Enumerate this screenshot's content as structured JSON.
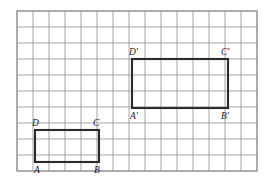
{
  "figure": {
    "background_color": "#ffffff",
    "grid": {
      "origin_x": 17,
      "origin_y": 11,
      "cell_size": 16,
      "columns": 15,
      "rows": 10,
      "line_color": "#9b9b9b",
      "faint_line_color": "#c9c9c9",
      "frame_color": "#8c8c8c",
      "show_grid": true
    },
    "shape_color": "#2b2b2b",
    "shapes": [
      {
        "name": "rectangle-abcd",
        "type": "rectangle",
        "grid_x": 1,
        "grid_y": 7.45,
        "grid_width": 4,
        "grid_height": 2,
        "px": {
          "x": 35,
          "y": 130,
          "width": 64,
          "height": 32
        },
        "vertices": [
          {
            "id": "A",
            "label": "A",
            "corner": "bottom-left",
            "label_x": 34,
            "label_y": 173
          },
          {
            "id": "B",
            "label": "B",
            "corner": "bottom-right",
            "label_x": 94,
            "label_y": 173
          },
          {
            "id": "C",
            "label": "C",
            "corner": "top-right",
            "label_x": 93,
            "label_y": 126
          },
          {
            "id": "D",
            "label": "D",
            "corner": "top-left",
            "label_x": 32,
            "label_y": 126
          }
        ]
      },
      {
        "name": "rectangle-abcd-prime",
        "type": "rectangle",
        "grid_x": 7.2,
        "grid_y": 3,
        "grid_width": 6,
        "grid_height": 3,
        "px": {
          "x": 132,
          "y": 59,
          "width": 96,
          "height": 49
        },
        "vertices": [
          {
            "id": "A-prime",
            "label": "A'",
            "corner": "bottom-left",
            "label_x": 130,
            "label_y": 119
          },
          {
            "id": "B-prime",
            "label": "B'",
            "corner": "bottom-right",
            "label_x": 221,
            "label_y": 119
          },
          {
            "id": "C-prime",
            "label": "C'",
            "corner": "top-right",
            "label_x": 221,
            "label_y": 55
          },
          {
            "id": "D-prime",
            "label": "D'",
            "corner": "top-left",
            "label_x": 129,
            "label_y": 55
          }
        ]
      }
    ]
  }
}
